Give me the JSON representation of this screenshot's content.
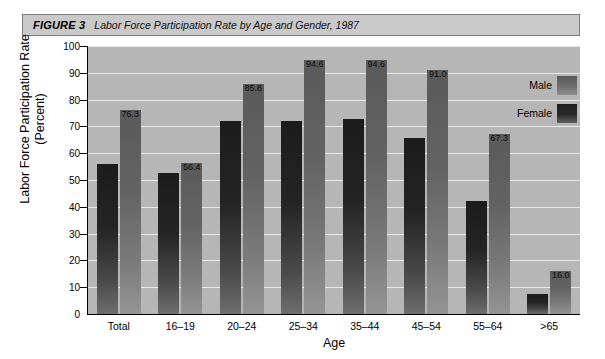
{
  "figure": {
    "label": "FIGURE 3",
    "title": "Labor Force Participation Rate by Age and Gender, 1987"
  },
  "legend": {
    "male_label": "Male",
    "female_label": "Female"
  },
  "colors": {
    "plot_background": "#b6b6b6",
    "caption_background": "#c9c9c9",
    "gridline": "#e9e9e9",
    "male_bar": "#7b7b7b",
    "female_bar": "#242424",
    "axis": "#000000"
  },
  "chart_data": {
    "type": "bar",
    "title": "Labor Force Participation Rate by Age and Gender, 1987",
    "xlabel": "Age",
    "ylabel": "Labor Force Participation Rate (Percent)",
    "ylim": [
      0,
      100
    ],
    "yticks": [
      0,
      10,
      20,
      30,
      40,
      50,
      60,
      70,
      80,
      90,
      100
    ],
    "ytick_labels": [
      "0",
      "10",
      "20",
      "30",
      "40",
      "50",
      "60",
      "70",
      "80",
      "90",
      "100"
    ],
    "grid": true,
    "legend_position": "upper right",
    "categories": [
      "Total",
      "16–19",
      "20–24",
      "25–34",
      "35–44",
      "45–54",
      "55–64",
      ">65"
    ],
    "series": [
      {
        "name": "Female",
        "values": [
          55.8,
          52.8,
          72.0,
          72.0,
          72.8,
          65.6,
          42.2,
          7.4
        ],
        "labels": [
          "",
          "",
          "",
          "",
          "",
          "",
          "",
          ""
        ]
      },
      {
        "name": "Male",
        "values": [
          76.3,
          56.4,
          85.8,
          94.6,
          94.6,
          91.0,
          67.3,
          16.0
        ],
        "labels": [
          "76.3",
          "56.4",
          "85.8",
          "94.6",
          "94.6",
          "91.0",
          "67.3",
          "16.0"
        ]
      }
    ]
  }
}
